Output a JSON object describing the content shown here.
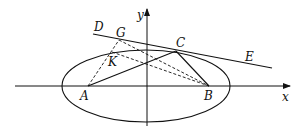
{
  "diagram": {
    "type": "ellipse-coordinate-geometry",
    "axes": {
      "x_label": "x",
      "y_label": "y"
    },
    "points": {
      "A": {
        "label": "A"
      },
      "B": {
        "label": "B"
      },
      "C": {
        "label": "C"
      },
      "D": {
        "label": "D"
      },
      "E": {
        "label": "E"
      },
      "G": {
        "label": "G"
      },
      "K": {
        "label": "K"
      }
    },
    "segments": {
      "solid": [
        "AC",
        "CB",
        "DE (tangent at C)"
      ],
      "dashed": [
        "AG",
        "GB",
        "KB"
      ]
    },
    "colors": {
      "stroke": "#111111",
      "background": "#ffffff"
    }
  }
}
